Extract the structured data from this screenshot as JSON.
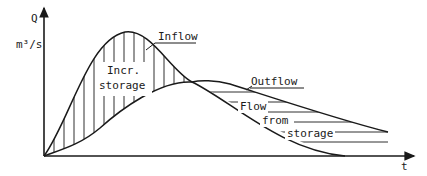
{
  "diagram": {
    "y_axis": {
      "label": "Q",
      "unit": "m³/s"
    },
    "x_axis": {
      "label": "t"
    },
    "curves": [
      {
        "name": "Inflow",
        "label": "Inflow"
      },
      {
        "name": "Outflow",
        "label": "Outflow"
      }
    ],
    "regions": [
      {
        "name": "increasing-storage",
        "label_line1": "Incr.",
        "label_line2": "storage",
        "hatch": "vertical"
      },
      {
        "name": "flow-from-storage",
        "label_line1": "Flow",
        "label_line2": "from",
        "label_line3": "storage",
        "hatch": "horizontal"
      }
    ],
    "colors": {
      "line": "#1a1a1a",
      "background": "#ffffff"
    }
  }
}
